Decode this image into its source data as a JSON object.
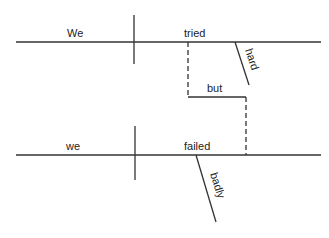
{
  "diagram": {
    "type": "sentence-diagram",
    "clause1": {
      "subject": "We",
      "verb": "tried",
      "modifier": "hard"
    },
    "conjunction": "but",
    "clause2": {
      "subject": "we",
      "verb": "failed",
      "modifier": "badly"
    },
    "line_color": "#333333"
  }
}
